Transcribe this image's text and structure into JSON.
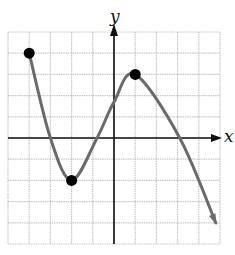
{
  "chart_data": {
    "type": "line",
    "title": "",
    "xlabel": "x",
    "ylabel": "y",
    "xlim": [
      -5,
      5
    ],
    "ylim": [
      -5,
      5
    ],
    "grid": true,
    "grid_step": 1,
    "tick_labels_shown": false,
    "legend": null,
    "series": [
      {
        "name": "f(x)",
        "points": [
          {
            "x": -4,
            "y": 4
          },
          {
            "x": -3,
            "y": 0
          },
          {
            "x": -2,
            "y": -2
          },
          {
            "x": -0.8,
            "y": 0
          },
          {
            "x": 0,
            "y": 1.7
          },
          {
            "x": 1,
            "y": 3
          },
          {
            "x": 3.1,
            "y": 0
          },
          {
            "x": 4.8,
            "y": -4
          }
        ],
        "end_arrow": "right"
      }
    ],
    "marked_points": [
      {
        "label": "left endpoint",
        "x": -4,
        "y": 4
      },
      {
        "label": "relative minimum",
        "x": -2,
        "y": -2
      },
      {
        "label": "relative maximum",
        "x": 1,
        "y": 3
      }
    ],
    "colors": {
      "curve": "#6b6b6b",
      "grid": "#c8c8c8",
      "axes": "#111111",
      "points": "#000000"
    }
  }
}
